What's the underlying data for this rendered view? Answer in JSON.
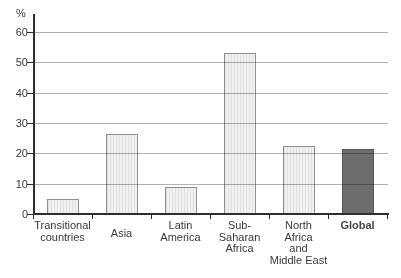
{
  "chart_data": {
    "type": "bar",
    "title": "",
    "ylabel": "%",
    "xlabel": "",
    "ylim": [
      0,
      60
    ],
    "yticks": [
      0,
      10,
      20,
      30,
      40,
      50,
      60
    ],
    "grid": true,
    "legend": false,
    "categories": [
      "Transitional countries",
      "Asia",
      "Latin America",
      "Sub-Saharan Africa",
      "North Africa and Middle East",
      "Global"
    ],
    "category_label_lines": [
      [
        "Transitional",
        "countries"
      ],
      [
        "Asia"
      ],
      [
        "Latin",
        "America"
      ],
      [
        "Sub-",
        "Saharan",
        "Africa"
      ],
      [
        "North",
        "Africa",
        "and",
        "Middle East"
      ],
      [
        "Global"
      ]
    ],
    "values": [
      5,
      26.5,
      9,
      53,
      22.5,
      21.5
    ],
    "highlighted_category": "Global",
    "colors": {
      "bar_fill": "#efefef",
      "bar_stripe": "#e0e0e0",
      "bar_border": "#8f8f8f",
      "highlight_fill": "#6d6d6d",
      "highlight_border": "#585858",
      "gridline": "#b2b2b2",
      "axis": "#2e2e2e",
      "text": "#3a3a3a"
    }
  }
}
